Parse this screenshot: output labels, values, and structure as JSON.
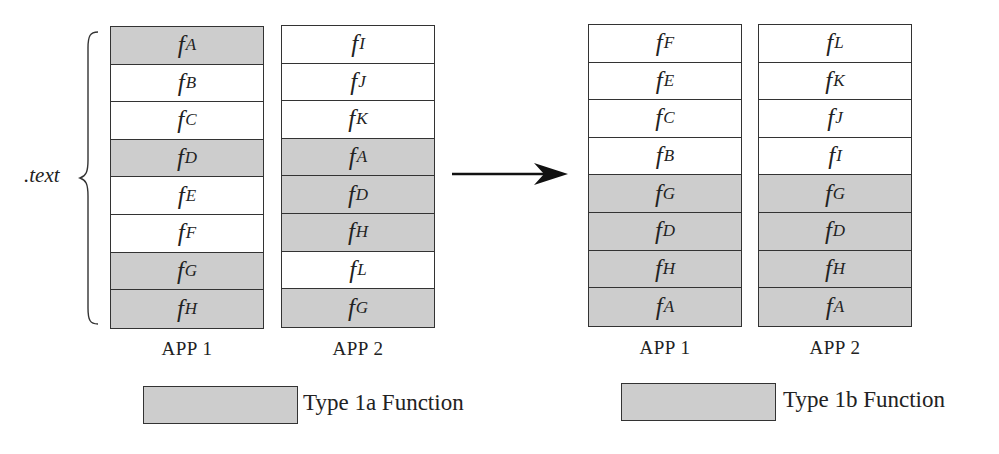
{
  "section_label": ".text",
  "before": {
    "app1": {
      "label": "APP 1",
      "cells": [
        {
          "name": "f",
          "sub": "A",
          "shaded": true
        },
        {
          "name": "f",
          "sub": "B",
          "shaded": false
        },
        {
          "name": "f",
          "sub": "C",
          "shaded": false
        },
        {
          "name": "f",
          "sub": "D",
          "shaded": true
        },
        {
          "name": "f",
          "sub": "E",
          "shaded": false
        },
        {
          "name": "f",
          "sub": "F",
          "shaded": false
        },
        {
          "name": "f",
          "sub": "G",
          "shaded": true
        },
        {
          "name": "f",
          "sub": "H",
          "shaded": true
        }
      ]
    },
    "app2": {
      "label": "APP 2",
      "cells": [
        {
          "name": "f",
          "sub": "I",
          "shaded": false
        },
        {
          "name": "f",
          "sub": "J",
          "shaded": false
        },
        {
          "name": "f",
          "sub": "K",
          "shaded": false
        },
        {
          "name": "f",
          "sub": "A",
          "shaded": true
        },
        {
          "name": "f",
          "sub": "D",
          "shaded": true
        },
        {
          "name": "f",
          "sub": "H",
          "shaded": true
        },
        {
          "name": "f",
          "sub": "L",
          "shaded": false
        },
        {
          "name": "f",
          "sub": "G",
          "shaded": true
        }
      ]
    }
  },
  "after": {
    "app1": {
      "label": "APP 1",
      "cells": [
        {
          "name": "f",
          "sub": "F",
          "shaded": false
        },
        {
          "name": "f",
          "sub": "E",
          "shaded": false
        },
        {
          "name": "f",
          "sub": "C",
          "shaded": false
        },
        {
          "name": "f",
          "sub": "B",
          "shaded": false
        },
        {
          "name": "f",
          "sub": "G",
          "shaded": true
        },
        {
          "name": "f",
          "sub": "D",
          "shaded": true
        },
        {
          "name": "f",
          "sub": "H",
          "shaded": true
        },
        {
          "name": "f",
          "sub": "A",
          "shaded": true
        }
      ]
    },
    "app2": {
      "label": "APP 2",
      "cells": [
        {
          "name": "f",
          "sub": "L",
          "shaded": false
        },
        {
          "name": "f",
          "sub": "K",
          "shaded": false
        },
        {
          "name": "f",
          "sub": "J",
          "shaded": false
        },
        {
          "name": "f",
          "sub": "I",
          "shaded": false
        },
        {
          "name": "f",
          "sub": "G",
          "shaded": true
        },
        {
          "name": "f",
          "sub": "D",
          "shaded": true
        },
        {
          "name": "f",
          "sub": "H",
          "shaded": true
        },
        {
          "name": "f",
          "sub": "A",
          "shaded": true
        }
      ]
    }
  },
  "legend": {
    "left": {
      "label": "Type 1a Function"
    },
    "right": {
      "label": "Type 1b Function"
    }
  },
  "colors": {
    "shaded": "#cdcdcd",
    "border": "#333333",
    "background": "#ffffff"
  }
}
